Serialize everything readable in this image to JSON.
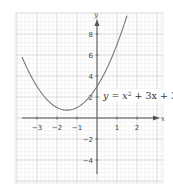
{
  "chart_data": {
    "type": "line",
    "title": "",
    "equation": "y = x² + 3x + 3",
    "equation_parts": {
      "lhs": "y = x",
      "sup": "2",
      "rhs": " + 3x + 3"
    },
    "xlabel": "x",
    "ylabel": "y",
    "xlim": [
      -4,
      3.3
    ],
    "ylim": [
      -6.2,
      10
    ],
    "grid": true,
    "x_ticks": [
      -3,
      -2,
      -1,
      1,
      2
    ],
    "y_ticks": [
      -4,
      -2,
      2,
      4,
      6,
      8
    ],
    "x_tick_labels": [
      "−3",
      "−2",
      "−1",
      "1",
      "2"
    ],
    "y_tick_labels": [
      "−4",
      "−2",
      "2",
      "4",
      "6",
      "8"
    ],
    "series": [
      {
        "name": "y = x² + 3x + 3",
        "x": [
          -3.75,
          -3.5,
          -3,
          -2.5,
          -2,
          -1.5,
          -1,
          -0.5,
          0,
          0.5,
          1,
          1.5
        ],
        "y": [
          5.81,
          4.75,
          3,
          1.75,
          1,
          0.75,
          1,
          1.75,
          3,
          4.75,
          7,
          9.75
        ]
      }
    ],
    "vertex": {
      "x": -1.5,
      "y": 0.75
    },
    "y_intercept": 3,
    "colors": {
      "curve": "#777777",
      "axes": "#555555",
      "grid_major": "#d0d0d0",
      "grid_minor": "#e8e8e8"
    }
  }
}
